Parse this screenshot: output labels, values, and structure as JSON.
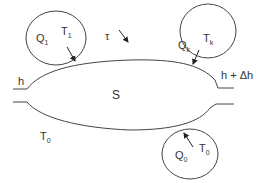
{
  "diagram": {
    "system_label": "S",
    "tau_label": "τ",
    "inlet_label": "h",
    "outlet_label": "h + Δh",
    "ambient_label": {
      "main": "T",
      "sub": "0"
    },
    "reservoirs": [
      {
        "id": "reservoir-1",
        "heat": {
          "main": "Q",
          "sub": "1"
        },
        "temp": {
          "main": "T",
          "sub": "1"
        }
      },
      {
        "id": "reservoir-k",
        "heat": {
          "main": "Q",
          "sub": "k"
        },
        "temp": {
          "main": "T",
          "sub": "k"
        }
      },
      {
        "id": "reservoir-0",
        "heat": {
          "main": "Q",
          "sub": "0"
        },
        "temp": {
          "main": "T",
          "sub": "0"
        }
      }
    ],
    "colors": {
      "stroke": "#444444",
      "text": "#333333",
      "background": "#ffffff"
    }
  }
}
